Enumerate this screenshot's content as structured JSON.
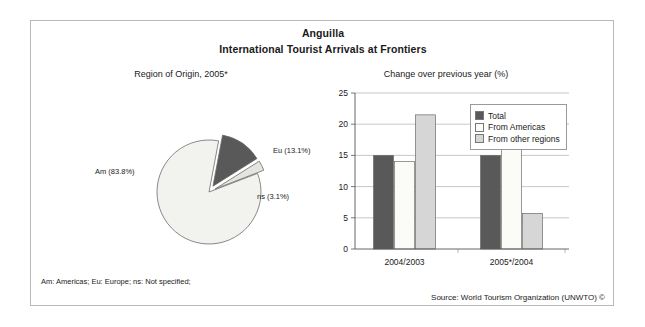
{
  "header": {
    "country": "Anguilla",
    "subtitle": "International Tourist Arrivals at Frontiers"
  },
  "panels": {
    "pie_title": "Region of Origin, 2005*",
    "bar_title": "Change over previous year (%)"
  },
  "footer": {
    "footnote": "Am: Americas; Eu: Europe; ns: Not specified;",
    "source": "Source: World Tourism Organization (UNWTO) ©"
  },
  "colors": {
    "total": "#595959",
    "from_americas": "#fbfbf7",
    "from_other_regions": "#d6d6d6",
    "pie_am": "#f2f2ee",
    "pie_eu": "#595959",
    "pie_ns": "#e4e4e0",
    "outline": "#6b6b6b",
    "grid": "#b0b0b0",
    "frame": "#b9b9b9"
  },
  "chart_data": [
    {
      "type": "pie",
      "title": "Region of Origin, 2005*",
      "categories": [
        "Am",
        "Eu",
        "ns"
      ],
      "labels": [
        "Am (83.8%)",
        "Eu (13.1%)",
        "ns (3.1%)"
      ],
      "values": [
        83.8,
        13.1,
        3.1
      ],
      "unit": "%",
      "exploded": [
        "Eu",
        "ns"
      ],
      "legend": "none",
      "notes": "Am: Americas; Eu: Europe; ns: Not specified;"
    },
    {
      "type": "bar",
      "title": "Change over previous year (%)",
      "categories": [
        "2004/2003",
        "2005*/2004"
      ],
      "series": [
        {
          "name": "Total",
          "values": [
            15.0,
            15.0
          ]
        },
        {
          "name": "From Americas",
          "values": [
            14.0,
            16.1
          ]
        },
        {
          "name": "From other regions",
          "values": [
            21.5,
            5.7
          ]
        }
      ],
      "xlabel": "",
      "ylabel": "",
      "ylim": [
        0,
        25
      ],
      "yticks": [
        0,
        5,
        10,
        15,
        20,
        25
      ],
      "ytick_labels": [
        "0",
        "5",
        "10",
        "15",
        "20",
        "25"
      ],
      "grid": true,
      "legend_position": "top-right"
    }
  ],
  "bar_axis": {
    "ticks": [
      "25",
      "20",
      "15",
      "10",
      "5",
      "0"
    ],
    "categories": [
      "2004/2003",
      "2005*/2004"
    ]
  },
  "bar_legend": [
    {
      "label": "Total",
      "color": "#595959"
    },
    {
      "label": "From Americas",
      "color": "#fbfbf7"
    },
    {
      "label": "From other regions",
      "color": "#d6d6d6"
    }
  ],
  "pie_labels": {
    "am": "Am (83.8%)",
    "eu": "Eu (13.1%)",
    "ns": "ns (3.1%)"
  }
}
